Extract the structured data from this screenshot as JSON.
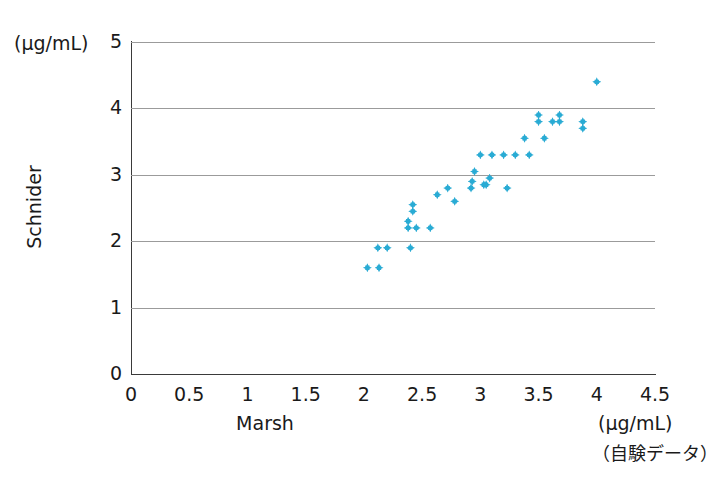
{
  "chart_data": {
    "type": "scatter",
    "title": "",
    "xlabel": "Marsh",
    "ylabel": "Schnider",
    "x_unit": "(μg/mL)",
    "y_unit": "(μg/mL)",
    "source_note": "（自験データ）",
    "xlim": [
      0,
      4.5
    ],
    "ylim": [
      0,
      5
    ],
    "xticks": [
      "0",
      "0.5",
      "1",
      "1.5",
      "2",
      "2.5",
      "3",
      "3.5",
      "4",
      "4.5"
    ],
    "xtick_values": [
      0,
      0.5,
      1,
      1.5,
      2,
      2.5,
      3,
      3.5,
      4,
      4.5
    ],
    "yticks": [
      "0",
      "1",
      "2",
      "3",
      "4",
      "5"
    ],
    "ytick_values": [
      0,
      1,
      2,
      3,
      4,
      5
    ],
    "grid": "horizontal",
    "legend": "none",
    "marker_color": "#29abd4",
    "marker_shape": "diamond",
    "series": [
      {
        "name": "Marsh vs Schnider",
        "points": [
          [
            2.03,
            1.6
          ],
          [
            2.13,
            1.6
          ],
          [
            2.12,
            1.9
          ],
          [
            2.2,
            1.9
          ],
          [
            2.4,
            1.9
          ],
          [
            2.38,
            2.2
          ],
          [
            2.38,
            2.3
          ],
          [
            2.45,
            2.2
          ],
          [
            2.57,
            2.2
          ],
          [
            2.42,
            2.45
          ],
          [
            2.42,
            2.55
          ],
          [
            2.63,
            2.7
          ],
          [
            2.78,
            2.6
          ],
          [
            2.72,
            2.8
          ],
          [
            2.95,
            3.05
          ],
          [
            2.92,
            2.8
          ],
          [
            2.93,
            2.9
          ],
          [
            3.0,
            3.3
          ],
          [
            3.03,
            2.85
          ],
          [
            3.05,
            2.85
          ],
          [
            3.08,
            2.95
          ],
          [
            3.1,
            3.3
          ],
          [
            3.2,
            3.3
          ],
          [
            3.23,
            2.8
          ],
          [
            3.3,
            3.3
          ],
          [
            3.38,
            3.55
          ],
          [
            3.42,
            3.3
          ],
          [
            3.5,
            3.8
          ],
          [
            3.5,
            3.9
          ],
          [
            3.55,
            3.55
          ],
          [
            3.62,
            3.8
          ],
          [
            3.68,
            3.8
          ],
          [
            3.68,
            3.9
          ],
          [
            3.88,
            3.7
          ],
          [
            3.88,
            3.8
          ],
          [
            4.0,
            4.4
          ]
        ]
      }
    ]
  }
}
